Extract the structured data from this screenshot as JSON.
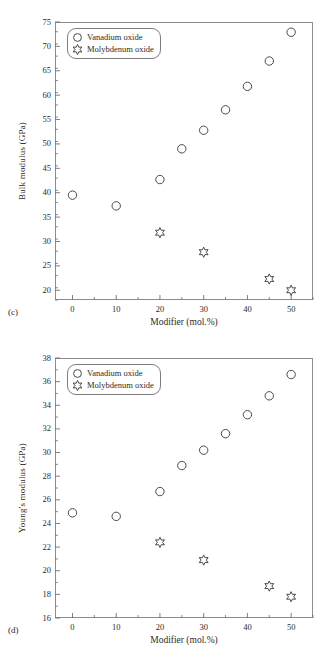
{
  "figure": {
    "panels": [
      {
        "tag": "(c)",
        "xlabel": "Modifier (mol.%)",
        "ylabel": "Bulk modulus (GPa)",
        "legend": [
          {
            "marker": "circle-marker-icon",
            "label": "Vanadium oxide"
          },
          {
            "marker": "star-marker-icon",
            "label": "Molybdenum oxide"
          }
        ],
        "xticks": [
          "0",
          "10",
          "20",
          "30",
          "40",
          "50"
        ],
        "yticks": [
          "20",
          "25",
          "30",
          "35",
          "40",
          "45",
          "50",
          "55",
          "60",
          "65",
          "70",
          "75"
        ]
      },
      {
        "tag": "(d)",
        "xlabel": "Modifier (mol.%)",
        "ylabel": "Young's modulus (GPa)",
        "legend": [
          {
            "marker": "circle-marker-icon",
            "label": "Vanadium oxide"
          },
          {
            "marker": "star-marker-icon",
            "label": "Molybdenum oxide"
          }
        ],
        "xticks": [
          "0",
          "10",
          "20",
          "30",
          "40",
          "50"
        ],
        "yticks": [
          "16",
          "18",
          "20",
          "22",
          "24",
          "26",
          "28",
          "30",
          "32",
          "34",
          "36",
          "38"
        ]
      }
    ]
  },
  "chart_data": [
    {
      "type": "scatter",
      "title": "",
      "panel_label": "(c)",
      "xlabel": "Modifier (mol.%)",
      "ylabel": "Bulk modulus (GPa)",
      "xlim": [
        -4,
        55
      ],
      "ylim": [
        18.0,
        75.0
      ],
      "xticks": [
        0,
        10,
        20,
        30,
        40,
        50
      ],
      "yticks": [
        20,
        25,
        30,
        35,
        40,
        45,
        50,
        55,
        60,
        65,
        70,
        75
      ],
      "minor_xtick_step": 5,
      "minor_ytick_step": 2.5,
      "grid": false,
      "legend_position": "upper-left",
      "series": [
        {
          "name": "Vanadium oxide",
          "marker": "circle",
          "x": [
            0,
            10,
            20,
            25,
            30,
            35,
            40,
            45,
            50
          ],
          "y": [
            39.5,
            37.3,
            42.7,
            49.0,
            52.8,
            57.0,
            61.8,
            67.0,
            72.9
          ]
        },
        {
          "name": "Molybdenum oxide",
          "marker": "star",
          "x": [
            20,
            30,
            45,
            50
          ],
          "y": [
            31.8,
            27.8,
            22.3,
            20.0
          ]
        }
      ]
    },
    {
      "type": "scatter",
      "title": "",
      "panel_label": "(d)",
      "xlabel": "Modifier (mol.%)",
      "ylabel": "Young's modulus (GPa)",
      "xlim": [
        -4,
        55
      ],
      "ylim": [
        16.0,
        38.0
      ],
      "xticks": [
        0,
        10,
        20,
        30,
        40,
        50
      ],
      "yticks": [
        16,
        18,
        20,
        22,
        24,
        26,
        28,
        30,
        32,
        34,
        36,
        38
      ],
      "minor_xtick_step": 5,
      "minor_ytick_step": 1,
      "grid": false,
      "legend_position": "upper-left",
      "series": [
        {
          "name": "Vanadium oxide",
          "marker": "circle",
          "x": [
            0,
            10,
            20,
            25,
            30,
            35,
            40,
            45,
            50
          ],
          "y": [
            24.9,
            24.6,
            26.7,
            28.9,
            30.2,
            31.6,
            33.2,
            34.8,
            36.6
          ]
        },
        {
          "name": "Molybdenum oxide",
          "marker": "star",
          "x": [
            20,
            30,
            45,
            50
          ],
          "y": [
            22.4,
            20.9,
            18.7,
            17.8
          ]
        }
      ]
    }
  ]
}
